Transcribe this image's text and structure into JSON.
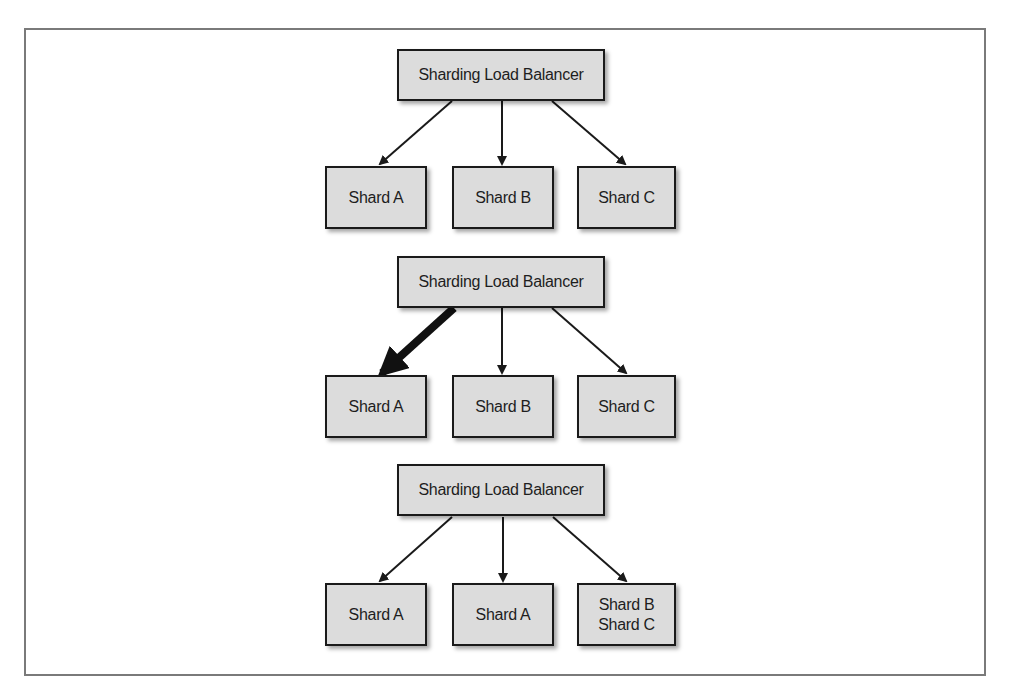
{
  "diagram": {
    "scenarios": [
      {
        "load_balancer": "Sharding Load Balancer",
        "shards": [
          {
            "label": "Shard A",
            "lines": [
              "Shard A"
            ]
          },
          {
            "label": "Shard B",
            "lines": [
              "Shard B"
            ]
          },
          {
            "label": "Shard C",
            "lines": [
              "Shard C"
            ]
          }
        ],
        "edges": [
          {
            "from": "Sharding Load Balancer",
            "to": "Shard A",
            "weight": "normal"
          },
          {
            "from": "Sharding Load Balancer",
            "to": "Shard B",
            "weight": "normal"
          },
          {
            "from": "Sharding Load Balancer",
            "to": "Shard C",
            "weight": "normal"
          }
        ]
      },
      {
        "load_balancer": "Sharding Load Balancer",
        "shards": [
          {
            "label": "Shard A",
            "lines": [
              "Shard A"
            ]
          },
          {
            "label": "Shard B",
            "lines": [
              "Shard B"
            ]
          },
          {
            "label": "Shard C",
            "lines": [
              "Shard C"
            ]
          }
        ],
        "edges": [
          {
            "from": "Sharding Load Balancer",
            "to": "Shard A",
            "weight": "heavy"
          },
          {
            "from": "Sharding Load Balancer",
            "to": "Shard B",
            "weight": "normal"
          },
          {
            "from": "Sharding Load Balancer",
            "to": "Shard C",
            "weight": "normal"
          }
        ]
      },
      {
        "load_balancer": "Sharding Load Balancer",
        "shards": [
          {
            "label": "Shard A",
            "lines": [
              "Shard A"
            ]
          },
          {
            "label": "Shard A",
            "lines": [
              "Shard A"
            ]
          },
          {
            "label": "Shard B / Shard C",
            "lines": [
              "Shard B",
              "Shard C"
            ]
          }
        ],
        "edges": [
          {
            "from": "Sharding Load Balancer",
            "to": "Shard A (1)",
            "weight": "normal"
          },
          {
            "from": "Sharding Load Balancer",
            "to": "Shard A (2)",
            "weight": "normal"
          },
          {
            "from": "Sharding Load Balancer",
            "to": "Shard B / Shard C",
            "weight": "normal"
          }
        ]
      }
    ],
    "colors": {
      "box_fill": "#dcdcdc",
      "box_border": "#1a1a1a",
      "arrow": "#1a1a1a",
      "frame_border": "#7a7a7a"
    }
  }
}
